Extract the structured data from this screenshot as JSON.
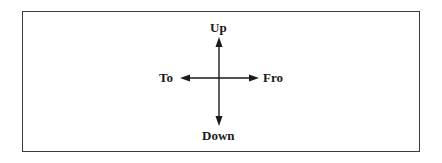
{
  "diagram": {
    "labels": {
      "up": "Up",
      "down": "Down",
      "to": "To",
      "fro": "Fro"
    },
    "colors": {
      "stroke": "#1a1a1a",
      "border": "#3a3a3a",
      "background": "#ffffff"
    },
    "arrows": [
      {
        "direction": "up",
        "label": "Up"
      },
      {
        "direction": "down",
        "label": "Down"
      },
      {
        "direction": "left",
        "label": "To"
      },
      {
        "direction": "right",
        "label": "Fro"
      }
    ]
  }
}
